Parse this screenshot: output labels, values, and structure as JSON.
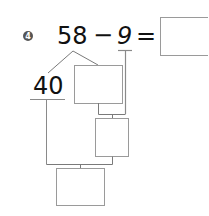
{
  "problem": {
    "number": "4",
    "minuend": "58",
    "operator": "−",
    "subtrahend": "9",
    "equals": "=",
    "decomposed_part": "40"
  },
  "boxes": [
    {
      "name": "answer-box",
      "value": ""
    },
    {
      "name": "remainder-box",
      "value": ""
    },
    {
      "name": "intermediate-box",
      "value": ""
    },
    {
      "name": "final-box",
      "value": ""
    }
  ],
  "colors": {
    "line": "#8a8a8a",
    "box_border": "#9a9a9a",
    "badge": "#555555",
    "text": "#111111"
  }
}
